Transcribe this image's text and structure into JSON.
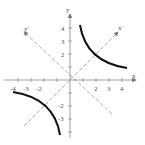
{
  "diagram": {
    "type": "rotated-hyperbola",
    "axes": {
      "x_label": "x",
      "y_label": "y",
      "rotated_x_label": "x'",
      "rotated_y_label": "y'",
      "rotation_degrees": 45
    },
    "x_ticks": [
      "-4",
      "-3",
      "-2",
      "2",
      "3",
      "4"
    ],
    "y_ticks": [
      "4",
      "3",
      "2",
      "-2",
      "-3"
    ],
    "curve": "xy = 4 (hyperbola branches in quadrants I and III)",
    "colors": {
      "curve": "#111111",
      "axes": "#888888",
      "rotated_axes": "#999999"
    }
  }
}
